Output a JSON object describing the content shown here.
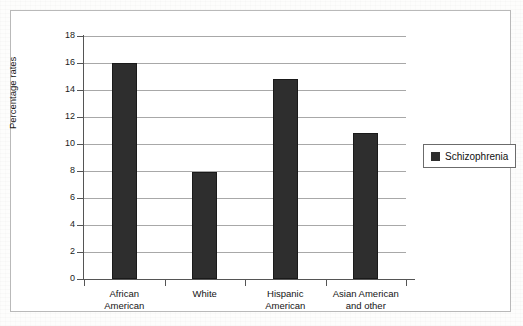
{
  "chart_data": {
    "type": "bar",
    "title": "",
    "subtitle": "",
    "xlabel": "",
    "ylabel": "Percentage rates",
    "categories": [
      "African American",
      "White",
      "Hispanic American",
      "Asian American and other"
    ],
    "category_lines": [
      [
        "African",
        "American"
      ],
      [
        "White"
      ],
      [
        "Hispanic",
        "American"
      ],
      [
        "Asian American",
        "and other"
      ]
    ],
    "series": [
      {
        "name": "Schizophrenia",
        "values": [
          16.0,
          7.9,
          14.8,
          10.8
        ],
        "color": "#2e2e2e"
      }
    ],
    "ylim": [
      0,
      18
    ],
    "ytick_step": 2,
    "ytick_labels": [
      "0",
      "2",
      "4",
      "6",
      "8",
      "10",
      "12",
      "14",
      "16",
      "18"
    ],
    "grid": true,
    "grid_axis": "y",
    "legend_position": "right",
    "legend_entries": [
      {
        "label": "Schizophrenia",
        "color": "#2e2e2e"
      }
    ]
  },
  "figure": {
    "frame_border_color": "#b9b9b9",
    "background_color": "#ffffff",
    "axis_color": "#555555",
    "gridline_color": "#a8a8a8",
    "text_color": "#141414"
  }
}
